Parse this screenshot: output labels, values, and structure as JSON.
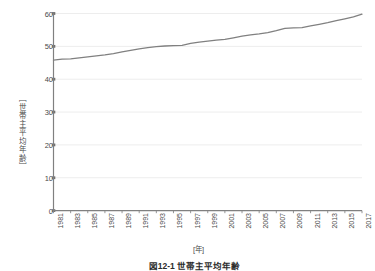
{
  "chart_data": {
    "type": "line",
    "title": "",
    "xlabel": "[年]",
    "ylabel": "［世帯主平均年齢］",
    "xlim": [
      1981,
      2017
    ],
    "ylim": [
      0,
      60
    ],
    "grid": true,
    "legend": "none",
    "line_color": "#808080",
    "axis_color": "#808080",
    "grid_color": "#ededed",
    "ytick_labels": [
      "60",
      "50",
      "40",
      "30",
      "20",
      "10",
      "0"
    ],
    "ytick_values": [
      60,
      50,
      40,
      30,
      20,
      10,
      0
    ],
    "xtick_labels": [
      "1981",
      "1983",
      "1985",
      "1987",
      "1989",
      "1991",
      "1993",
      "1995",
      "1997",
      "1999",
      "2001",
      "2003",
      "2005",
      "2007",
      "2009",
      "2011",
      "2013",
      "2015",
      "2017"
    ],
    "series": [
      {
        "name": "世帯主平均年齢",
        "x": [
          1981,
          1982,
          1983,
          1984,
          1985,
          1986,
          1987,
          1988,
          1989,
          1990,
          1991,
          1992,
          1993,
          1994,
          1995,
          1996,
          1997,
          1998,
          1999,
          2000,
          2001,
          2002,
          2003,
          2004,
          2005,
          2006,
          2007,
          2008,
          2009,
          2010,
          2011,
          2012,
          2013,
          2014,
          2015,
          2016,
          2017
        ],
        "values": [
          45.8,
          46.1,
          46.2,
          46.5,
          46.8,
          47.1,
          47.4,
          47.8,
          48.3,
          48.8,
          49.2,
          49.6,
          49.9,
          50.1,
          50.2,
          50.3,
          50.9,
          51.3,
          51.6,
          51.9,
          52.1,
          52.6,
          53.1,
          53.5,
          53.8,
          54.2,
          54.8,
          55.5,
          55.6,
          55.7,
          56.2,
          56.7,
          57.2,
          57.8,
          58.4,
          59.0,
          59.8
        ]
      }
    ]
  },
  "caption": {
    "text": "図12-1 世帯主平均年齢"
  }
}
